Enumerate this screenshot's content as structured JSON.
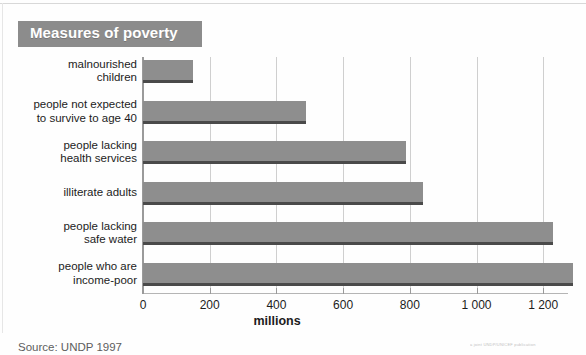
{
  "figure": {
    "title": "Measures of poverty",
    "source": "Source: UNDP 1997",
    "credit": "a joint UNDP/UNICEF publication"
  },
  "chart_data": {
    "type": "bar",
    "orientation": "horizontal",
    "title": "Measures of poverty",
    "xlabel": "millions",
    "ylabel": "",
    "xlim": [
      0,
      1300
    ],
    "grid": true,
    "legend": "none",
    "xticks": [
      0,
      200,
      400,
      600,
      800,
      1000,
      1200
    ],
    "xtick_labels": [
      "0",
      "200",
      "400",
      "600",
      "800",
      "1 000",
      "1 200"
    ],
    "categories": [
      "malnourished\nchildren",
      "people not expected\nto survive to age 40",
      "people lacking\nhealth services",
      "illiterate adults",
      "people lacking\nsafe water",
      "people who are\nincome-poor"
    ],
    "category_lines": [
      [
        "malnourished",
        "children"
      ],
      [
        "people not expected",
        "to survive to age 40"
      ],
      [
        "people lacking",
        "health services"
      ],
      [
        "illiterate adults"
      ],
      [
        "people lacking",
        "safe water"
      ],
      [
        "people who are",
        "income-poor"
      ]
    ],
    "values": [
      150,
      490,
      790,
      840,
      1230,
      1290
    ],
    "units": "millions",
    "bar_color": "#8e8e8e",
    "title_banner_color": "#8c8c8c",
    "gridline_color": "#cfcfcf"
  }
}
